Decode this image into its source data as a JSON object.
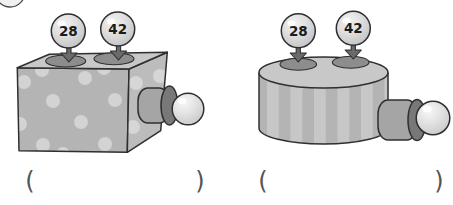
{
  "figure": {
    "corner_fragment": "bubble-edge",
    "machines": [
      {
        "name": "dotted-box-machine",
        "style": "polka-dot-box",
        "inputs": [
          "28",
          "42"
        ],
        "answer_open": "(",
        "answer_close": ")"
      },
      {
        "name": "striped-cylinder-machine",
        "style": "vertical-stripe-drum",
        "inputs": [
          "28",
          "42"
        ],
        "answer_open": "(",
        "answer_close": ")"
      }
    ],
    "colors": {
      "outline": "#2f2f2f",
      "box_top": "#c8c8c8",
      "box_front": "#b4b4b4",
      "box_side": "#bcbcbc",
      "polka_dot": "#d3d3d3",
      "input_hole": "#8d8d8d",
      "funnel_arrow": "#6a6a6a",
      "spout_body": "#a5a5a5",
      "spout_ring": "#787878",
      "drum_base": "#b4b4b4",
      "drum_stripe": "#c7c7c7",
      "drum_top": "#c8c8c8",
      "paren": "#545454"
    }
  }
}
